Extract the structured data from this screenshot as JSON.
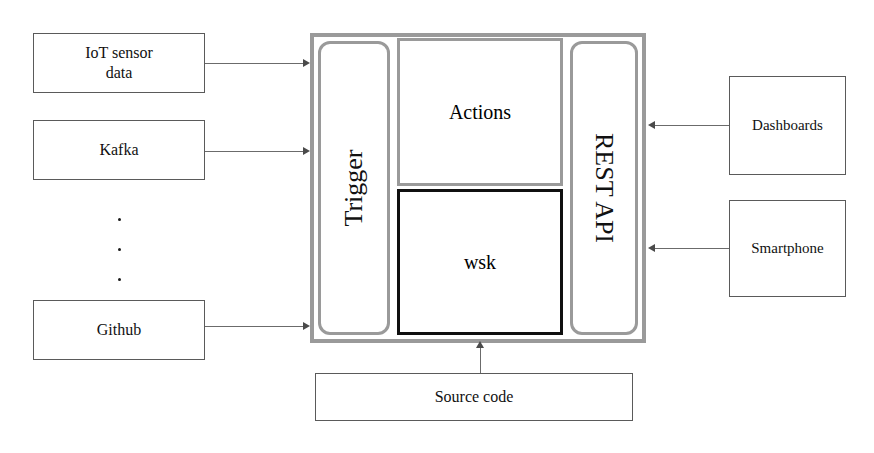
{
  "diagram": {
    "colors": {
      "panel_gray": "#9a9a9a",
      "panel_black": "#101010",
      "box_outline": "#5a5a5a",
      "connector": "#6b6b6b",
      "background": "#ffffff"
    },
    "sources": [
      {
        "id": "iot-sensor-data",
        "label": "IoT sensor\ndata",
        "line1": "IoT sensor",
        "line2": "data"
      },
      {
        "id": "kafka",
        "label": "Kafka"
      },
      {
        "id": "github",
        "label": "Github"
      }
    ],
    "ellipsis": {
      "symbol": ".",
      "count": 3
    },
    "platform": {
      "trigger": {
        "label": "Trigger"
      },
      "actions": {
        "label": "Actions"
      },
      "wsk": {
        "label": "wsk"
      },
      "rest_api": {
        "label": "REST API"
      }
    },
    "consumers": [
      {
        "id": "dashboards",
        "label": "Dashboards"
      },
      {
        "id": "smartphone",
        "label": "Smartphone"
      }
    ],
    "source_code": {
      "label": "Source code"
    },
    "connections": [
      {
        "from": "IoT sensor data",
        "to": "Trigger",
        "direction": "right"
      },
      {
        "from": "Kafka",
        "to": "Trigger",
        "direction": "right"
      },
      {
        "from": "Github",
        "to": "Trigger",
        "direction": "right"
      },
      {
        "from": "Dashboards",
        "to": "REST API",
        "direction": "left"
      },
      {
        "from": "Smartphone",
        "to": "REST API",
        "direction": "left"
      },
      {
        "from": "Source code",
        "to": "wsk",
        "direction": "up"
      }
    ]
  }
}
